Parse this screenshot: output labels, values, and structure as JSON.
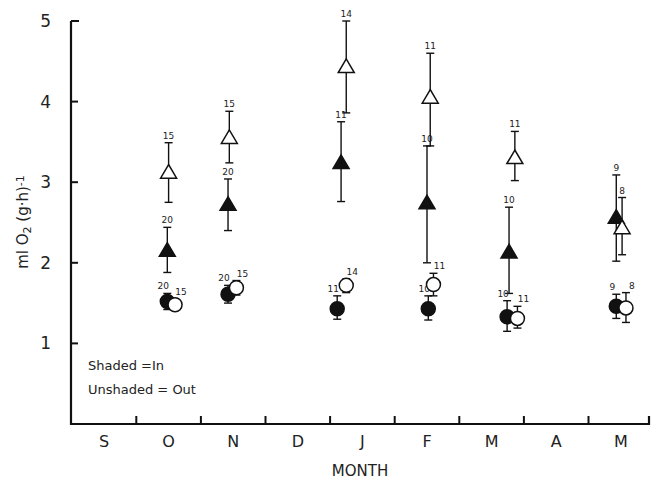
{
  "chart_data": {
    "type": "scatter",
    "title": "",
    "xlabel": "MONTH",
    "ylabel": "ml O2 (g·h)-1",
    "ylim": [
      0,
      5
    ],
    "yticks": [
      1,
      2,
      3,
      4,
      5
    ],
    "x_categories": [
      "S",
      "O",
      "N",
      "D",
      "J",
      "F",
      "M",
      "A",
      "M"
    ],
    "x_note": "x values in month-index units (S = 0)",
    "grid": false,
    "legend": {
      "placement": "bottom-left",
      "entries": [
        "Shaded =In",
        "Unshaded = Out"
      ]
    },
    "series": [
      {
        "name": "Triangle In (shaded)",
        "marker": "triangle-filled",
        "points": [
          {
            "x": 0.98,
            "y": 2.15,
            "low": 1.88,
            "high": 2.44,
            "n": "20"
          },
          {
            "x": 1.92,
            "y": 2.72,
            "low": 2.4,
            "high": 3.04,
            "n": "20"
          },
          {
            "x": 3.67,
            "y": 3.24,
            "low": 2.76,
            "high": 3.75,
            "n": "11"
          },
          {
            "x": 5.0,
            "y": 2.74,
            "low": 2.0,
            "high": 3.45,
            "n": "10"
          },
          {
            "x": 6.27,
            "y": 2.13,
            "low": 1.62,
            "high": 2.69,
            "n": "10"
          },
          {
            "x": 7.93,
            "y": 2.56,
            "low": 2.02,
            "high": 3.09,
            "n": "9"
          }
        ]
      },
      {
        "name": "Triangle Out (unshaded)",
        "marker": "triangle-open",
        "points": [
          {
            "x": 1.0,
            "y": 3.12,
            "low": 2.75,
            "high": 3.49,
            "n": "15"
          },
          {
            "x": 1.94,
            "y": 3.55,
            "low": 3.24,
            "high": 3.88,
            "n": "15"
          },
          {
            "x": 3.75,
            "y": 4.43,
            "low": 3.86,
            "high": 5.0,
            "n": "14"
          },
          {
            "x": 5.05,
            "y": 4.05,
            "low": 3.45,
            "high": 4.6,
            "n": "11"
          },
          {
            "x": 6.36,
            "y": 3.3,
            "low": 3.02,
            "high": 3.63,
            "n": "11"
          },
          {
            "x": 8.02,
            "y": 2.43,
            "low": 2.1,
            "high": 2.81,
            "n": "8"
          }
        ]
      },
      {
        "name": "Circle In (shaded)",
        "marker": "circle-filled",
        "points": [
          {
            "x": 0.98,
            "y": 1.52,
            "low": 1.42,
            "high": 1.62,
            "n": "20"
          },
          {
            "x": 1.92,
            "y": 1.61,
            "low": 1.5,
            "high": 1.72,
            "n": "20"
          },
          {
            "x": 3.61,
            "y": 1.43,
            "low": 1.3,
            "high": 1.59,
            "n": "11"
          },
          {
            "x": 5.02,
            "y": 1.43,
            "low": 1.29,
            "high": 1.59,
            "n": "10"
          },
          {
            "x": 6.24,
            "y": 1.33,
            "low": 1.15,
            "high": 1.53,
            "n": "10"
          },
          {
            "x": 7.93,
            "y": 1.46,
            "low": 1.31,
            "high": 1.61,
            "n": "9"
          }
        ]
      },
      {
        "name": "Circle Out (unshaded)",
        "marker": "circle-open",
        "points": [
          {
            "x": 1.1,
            "y": 1.48,
            "low": 1.42,
            "high": 1.55,
            "n": "15"
          },
          {
            "x": 2.05,
            "y": 1.69,
            "low": 1.6,
            "high": 1.78,
            "n": "15"
          },
          {
            "x": 3.75,
            "y": 1.72,
            "low": 1.63,
            "high": 1.8,
            "n": "14"
          },
          {
            "x": 5.1,
            "y": 1.73,
            "low": 1.59,
            "high": 1.87,
            "n": "11"
          },
          {
            "x": 6.4,
            "y": 1.31,
            "low": 1.19,
            "high": 1.46,
            "n": "11"
          },
          {
            "x": 8.08,
            "y": 1.44,
            "low": 1.26,
            "high": 1.63,
            "n": "8"
          }
        ]
      }
    ]
  }
}
